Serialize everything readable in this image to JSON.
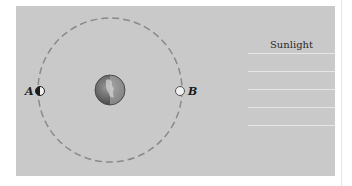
{
  "diagram": {
    "sunlight_label": "Sunlight",
    "moon_positions": [
      {
        "id": "A",
        "label": "A",
        "phase": "half-lit (lit side facing right)"
      },
      {
        "id": "B",
        "label": "B",
        "phase": "fully lit (open circle)"
      }
    ],
    "central_body": "Earth",
    "orbit_style": "dashed circle",
    "sunlight_ray_count": 5,
    "colors": {
      "background_panel": "#c9c9c9",
      "orbit": "#8a8a8a",
      "sunlight_rays": "#e6e6e6",
      "moon_dark": "#1e1e1e",
      "moon_lit": "#f0f0f0",
      "earth_dark": "#4a4a4a",
      "earth_lit": "#a8a8a8"
    }
  }
}
